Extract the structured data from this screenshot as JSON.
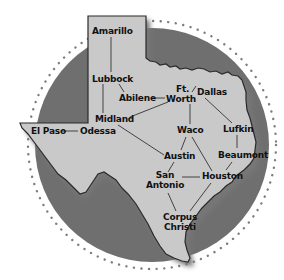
{
  "map": {
    "region": "Texas",
    "colors": {
      "background": "#ffffff",
      "circle_fill": "#6f6f6f",
      "circle_dots": "#7a7a7a",
      "state_fill": "#c9c9c9",
      "state_outline": "#2a2a2a",
      "shadow": "#8a8a8a",
      "label": "#111111",
      "connector": "#333333"
    },
    "cities": [
      {
        "id": "amarillo",
        "label": "Amarillo",
        "x": 92,
        "y": 27
      },
      {
        "id": "lubbock",
        "label": "Lubbock",
        "x": 92,
        "y": 74
      },
      {
        "id": "abilene",
        "label": "Abilene",
        "x": 119,
        "y": 94
      },
      {
        "id": "ft-worth",
        "label_line1": "Ft.",
        "label_line2": "Worth",
        "x": 167,
        "y": 85
      },
      {
        "id": "dallas",
        "label": "Dallas",
        "x": 196,
        "y": 88
      },
      {
        "id": "midland",
        "label": "Midland",
        "x": 95,
        "y": 115
      },
      {
        "id": "el-paso",
        "label": "El Paso",
        "x": 31,
        "y": 127
      },
      {
        "id": "odessa",
        "label": "Odessa",
        "x": 80,
        "y": 127
      },
      {
        "id": "waco",
        "label": "Waco",
        "x": 177,
        "y": 126
      },
      {
        "id": "lufkin",
        "label": "Lufkin",
        "x": 223,
        "y": 125
      },
      {
        "id": "austin",
        "label": "Austin",
        "x": 165,
        "y": 152
      },
      {
        "id": "beaumont",
        "label": "Beaumont",
        "x": 218,
        "y": 151
      },
      {
        "id": "san-antonio",
        "label_line1": "San",
        "label_line2": "Antonio",
        "x": 148,
        "y": 171
      },
      {
        "id": "houston",
        "label": "Houston",
        "x": 202,
        "y": 172
      },
      {
        "id": "corpus-christi",
        "label_line1": "Corpus",
        "label_line2": "Christi",
        "x": 165,
        "y": 213
      }
    ],
    "connections": [
      [
        "Amarillo",
        "Lubbock"
      ],
      [
        "Lubbock",
        "Midland"
      ],
      [
        "Lubbock",
        "Abilene"
      ],
      [
        "Abilene",
        "Ft. Worth"
      ],
      [
        "Midland",
        "Ft. Worth"
      ],
      [
        "Ft. Worth",
        "Dallas"
      ],
      [
        "Ft. Worth",
        "Waco"
      ],
      [
        "Dallas",
        "Lufkin"
      ],
      [
        "Lufkin",
        "Beaumont"
      ],
      [
        "Beaumont",
        "Houston"
      ],
      [
        "El Paso",
        "Odessa"
      ],
      [
        "Midland",
        "Austin"
      ],
      [
        "Waco",
        "Austin"
      ],
      [
        "Waco",
        "Houston"
      ],
      [
        "Austin",
        "San Antonio"
      ],
      [
        "San Antonio",
        "Houston"
      ],
      [
        "San Antonio",
        "Corpus Christi"
      ],
      [
        "Houston",
        "Corpus Christi"
      ]
    ]
  }
}
